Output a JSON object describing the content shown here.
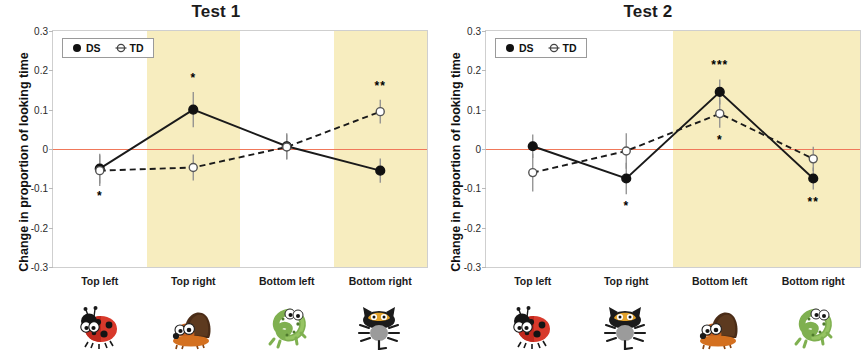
{
  "figure": {
    "y_axis_title": "Change in proportion of looking time",
    "legend": {
      "ds": "DS",
      "td": "TD"
    }
  },
  "chart_data": [
    {
      "type": "line",
      "title": "Test 1",
      "xlabel": "",
      "ylabel": "Change in proportion of looking time",
      "ylim": [
        -0.3,
        0.3
      ],
      "yticks": [
        "0.3",
        "0.2",
        "0.1",
        "0",
        "-0.1",
        "-0.2",
        "-0.3"
      ],
      "ytick_values": [
        0.3,
        0.2,
        0.1,
        0,
        -0.1,
        -0.2,
        -0.3
      ],
      "grid": false,
      "zero_line": true,
      "zero_line_color": "#f0785a",
      "legend_position": "top-left",
      "categories": [
        "Top left",
        "Top right",
        "Bottom left",
        "Bottom right"
      ],
      "highlight_color": "#f7edbf",
      "highlighted_categories": [
        "Top right",
        "Bottom right"
      ],
      "series": [
        {
          "name": "DS",
          "marker": "filled-circle",
          "line": "solid",
          "values": [
            -0.05,
            0.1,
            0.007,
            -0.055
          ],
          "errors": [
            0.038,
            0.045,
            0.033,
            0.031
          ]
        },
        {
          "name": "TD",
          "marker": "open-circle",
          "line": "dashed",
          "values": [
            -0.055,
            -0.047,
            0.005,
            0.095
          ],
          "errors": [
            0.039,
            0.033,
            0.032,
            0.03
          ]
        }
      ],
      "annotations": [
        {
          "category": "Top left",
          "series": "DS",
          "text": "*",
          "position": "below"
        },
        {
          "category": "Top right",
          "series": "DS",
          "text": "*",
          "position": "above"
        },
        {
          "category": "Bottom right",
          "series": "TD",
          "text": "**",
          "position": "above"
        }
      ],
      "stimuli": [
        "ladybug",
        "hedgehog",
        "lizard",
        "cat"
      ]
    },
    {
      "type": "line",
      "title": "Test 2",
      "xlabel": "",
      "ylabel": "Change in proportion of looking time",
      "ylim": [
        -0.3,
        0.3
      ],
      "yticks": [
        "0.3",
        "0.2",
        "0.1",
        "0",
        "-0.1",
        "-0.2",
        "-0.3"
      ],
      "ytick_values": [
        0.3,
        0.2,
        0.1,
        0,
        -0.1,
        -0.2,
        -0.3
      ],
      "grid": false,
      "zero_line": true,
      "zero_line_color": "#f0785a",
      "legend_position": "top-left",
      "categories": [
        "Top left",
        "Top right",
        "Bottom left",
        "Bottom right"
      ],
      "highlight_color": "#f7edbf",
      "highlighted_categories": [
        "Bottom left",
        "Bottom right"
      ],
      "series": [
        {
          "name": "DS",
          "marker": "filled-circle",
          "line": "solid",
          "values": [
            0.007,
            -0.075,
            0.145,
            -0.075
          ],
          "errors": [
            0.03,
            0.04,
            0.032,
            0.028
          ]
        },
        {
          "name": "TD",
          "marker": "open-circle",
          "line": "dashed",
          "values": [
            -0.06,
            -0.005,
            0.09,
            -0.025
          ],
          "errors": [
            0.048,
            0.045,
            0.036,
            0.031
          ]
        }
      ],
      "annotations": [
        {
          "category": "Top right",
          "series": "DS",
          "text": "*",
          "position": "below"
        },
        {
          "category": "Bottom left",
          "series": "DS",
          "text": "***",
          "position": "above"
        },
        {
          "category": "Bottom left",
          "series": "TD",
          "text": "*",
          "position": "below"
        },
        {
          "category": "Bottom right",
          "series": "DS",
          "text": "**",
          "position": "below"
        }
      ],
      "stimuli": [
        "ladybug",
        "cat",
        "hedgehog",
        "lizard"
      ]
    }
  ]
}
